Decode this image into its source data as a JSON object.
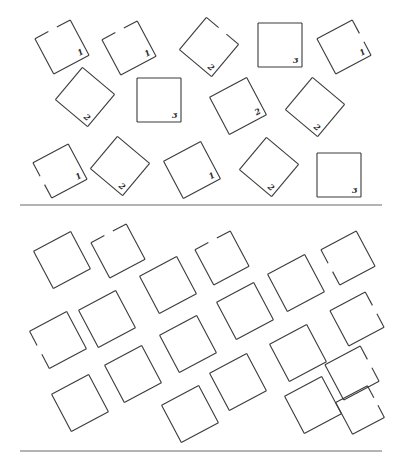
{
  "figure": {
    "colors": {
      "stroke": "#3a3a3a",
      "background": "#ffffff",
      "separator": "#6a6a6a"
    },
    "top_panel": {
      "separator_y": 205,
      "squares": [
        {
          "cx": 62,
          "cy": 47,
          "size": 40,
          "angle": -28,
          "label": "1",
          "gap": "top"
        },
        {
          "cx": 129,
          "cy": 48,
          "size": 40,
          "angle": -28,
          "label": "1",
          "gap": "top"
        },
        {
          "cx": 209,
          "cy": 47,
          "size": 42,
          "angle": 40,
          "label": "2",
          "gap": "top"
        },
        {
          "cx": 280,
          "cy": 45,
          "size": 44,
          "angle": 0,
          "label": "3",
          "gap": ""
        },
        {
          "cx": 344,
          "cy": 47,
          "size": 40,
          "angle": -28,
          "label": "1",
          "gap": "right"
        },
        {
          "cx": 85,
          "cy": 97,
          "size": 42,
          "angle": 40,
          "label": "2",
          "gap": ""
        },
        {
          "cx": 159,
          "cy": 100,
          "size": 44,
          "angle": 0,
          "label": "3",
          "gap": ""
        },
        {
          "cx": 238,
          "cy": 106,
          "size": 42,
          "angle": -28,
          "label": "2",
          "gap": ""
        },
        {
          "cx": 315,
          "cy": 107,
          "size": 42,
          "angle": 40,
          "label": "2",
          "gap": ""
        },
        {
          "cx": 60,
          "cy": 171,
          "size": 40,
          "angle": -28,
          "label": "1",
          "gap": "left"
        },
        {
          "cx": 120,
          "cy": 166,
          "size": 42,
          "angle": 40,
          "label": "2",
          "gap": ""
        },
        {
          "cx": 192,
          "cy": 170,
          "size": 42,
          "angle": -28,
          "label": "1",
          "gap": ""
        },
        {
          "cx": 269,
          "cy": 167,
          "size": 42,
          "angle": 40,
          "label": "2",
          "gap": ""
        },
        {
          "cx": 339,
          "cy": 175,
          "size": 44,
          "angle": 0,
          "label": "3",
          "gap": ""
        }
      ]
    },
    "bottom_panel": {
      "separator_y": 451,
      "squares": [
        {
          "cx": 62,
          "cy": 260,
          "size": 42,
          "angle": -28,
          "gap": ""
        },
        {
          "cx": 118,
          "cy": 251,
          "size": 40,
          "angle": -28,
          "gap": "top"
        },
        {
          "cx": 168,
          "cy": 285,
          "size": 42,
          "angle": -28,
          "gap": ""
        },
        {
          "cx": 222,
          "cy": 258,
          "size": 40,
          "angle": -28,
          "gap": "top"
        },
        {
          "cx": 296,
          "cy": 283,
          "size": 42,
          "angle": -28,
          "gap": ""
        },
        {
          "cx": 348,
          "cy": 258,
          "size": 40,
          "angle": -28,
          "gap": "left"
        },
        {
          "cx": 107,
          "cy": 319,
          "size": 42,
          "angle": -28,
          "gap": ""
        },
        {
          "cx": 58,
          "cy": 340,
          "size": 42,
          "angle": -28,
          "gap": "left"
        },
        {
          "cx": 245,
          "cy": 311,
          "size": 42,
          "angle": -28,
          "gap": ""
        },
        {
          "cx": 357,
          "cy": 319,
          "size": 40,
          "angle": -28,
          "gap": "right"
        },
        {
          "cx": 188,
          "cy": 344,
          "size": 42,
          "angle": -28,
          "gap": ""
        },
        {
          "cx": 298,
          "cy": 353,
          "size": 42,
          "angle": -28,
          "gap": ""
        },
        {
          "cx": 133,
          "cy": 374,
          "size": 42,
          "angle": -28,
          "gap": ""
        },
        {
          "cx": 80,
          "cy": 403,
          "size": 42,
          "angle": -28,
          "gap": ""
        },
        {
          "cx": 238,
          "cy": 382,
          "size": 42,
          "angle": -28,
          "gap": ""
        },
        {
          "cx": 352,
          "cy": 373,
          "size": 40,
          "angle": -28,
          "gap": "right"
        },
        {
          "cx": 190,
          "cy": 414,
          "size": 42,
          "angle": -28,
          "gap": ""
        },
        {
          "cx": 313,
          "cy": 405,
          "size": 42,
          "angle": -28,
          "gap": ""
        },
        {
          "cx": 360,
          "cy": 410,
          "size": 36,
          "angle": -28,
          "gap": "right"
        }
      ]
    }
  }
}
